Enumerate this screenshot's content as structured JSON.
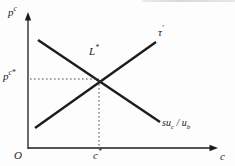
{
  "diagram": {
    "background": "#fdfdfd",
    "line_color": "#1c1c1c",
    "dotted_color": "#4a4a4a",
    "axes": {
      "y_label_base": "p",
      "y_label_sup": "c",
      "x_label": "c",
      "origin_label": "O"
    },
    "reference": {
      "price_base": "p",
      "price_sup": "c*",
      "quantity_base": "c",
      "quantity_sup": "*"
    },
    "intersection": {
      "base": "L",
      "sup": "*"
    },
    "curves": {
      "upward": {
        "base": "τ",
        "sup": "′"
      },
      "downward": {
        "part1": "su",
        "sub1": "c",
        "mid": " / ",
        "part2": "u",
        "sub2": "b"
      }
    }
  }
}
